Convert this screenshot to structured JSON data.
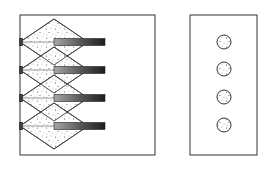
{
  "figure": {
    "colors": {
      "outline": "#333333",
      "stipple": "#222222",
      "bar_dark": "#2a2a2a",
      "bar_light": "#9a9a9a",
      "background": "#ffffff"
    },
    "left_panel": {
      "box": {
        "x": 20,
        "y": 15,
        "w": 135,
        "h": 140
      },
      "emitters": [
        {
          "row": 1,
          "cy": 42
        },
        {
          "row": 2,
          "cy": 70
        },
        {
          "row": 3,
          "cy": 98
        },
        {
          "row": 4,
          "cy": 126
        }
      ],
      "diamond": {
        "left_x": 20,
        "apex_x": 54,
        "right_x": 88,
        "half_height": 23
      },
      "bar": {
        "x": 54,
        "w": 51,
        "h": 7
      }
    },
    "right_panel": {
      "box": {
        "x": 190,
        "y": 15,
        "w": 67,
        "h": 140
      },
      "spots": [
        {
          "cx": 224,
          "cy": 42,
          "r": 7
        },
        {
          "cx": 224,
          "cy": 69,
          "r": 7
        },
        {
          "cx": 224,
          "cy": 97,
          "r": 7
        },
        {
          "cx": 224,
          "cy": 125,
          "r": 7
        }
      ]
    }
  }
}
